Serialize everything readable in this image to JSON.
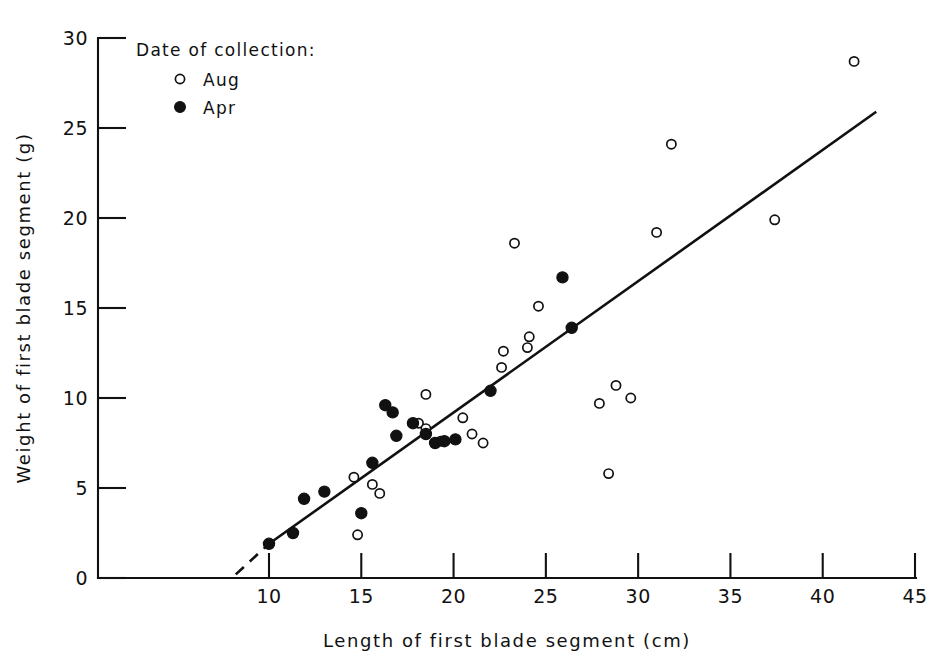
{
  "chart_data": {
    "type": "scatter",
    "title": "",
    "xlabel": "Length of first blade segment (cm)",
    "ylabel": "Weight of first blade segment (g)",
    "xlim": [
      7.0,
      45.0
    ],
    "ylim": [
      0,
      30
    ],
    "xticks": [
      10,
      15,
      20,
      25,
      30,
      35,
      40,
      45
    ],
    "yticks": [
      0,
      5,
      10,
      15,
      20,
      25,
      30
    ],
    "xtick_labels": [
      "10",
      "15",
      "20",
      "25",
      "30",
      "35",
      "40",
      "45"
    ],
    "ytick_labels": [
      "0",
      "5",
      "10",
      "15",
      "20",
      "25",
      "30"
    ],
    "grid": false,
    "legend_position": "top-left",
    "legend_title": "Date of collection:",
    "series": [
      {
        "name": "Aug",
        "marker": "open-circle",
        "color": "#111111",
        "points": [
          [
            14.6,
            5.6
          ],
          [
            14.8,
            2.4
          ],
          [
            15.6,
            5.2
          ],
          [
            16.0,
            4.7
          ],
          [
            18.1,
            8.6
          ],
          [
            18.5,
            8.3
          ],
          [
            18.5,
            10.2
          ],
          [
            19.3,
            7.6
          ],
          [
            20.5,
            8.9
          ],
          [
            21.0,
            8.0
          ],
          [
            21.6,
            7.5
          ],
          [
            22.6,
            11.7
          ],
          [
            22.7,
            12.6
          ],
          [
            23.3,
            18.6
          ],
          [
            24.0,
            12.8
          ],
          [
            24.1,
            13.4
          ],
          [
            24.6,
            15.1
          ],
          [
            27.9,
            9.7
          ],
          [
            28.4,
            5.8
          ],
          [
            28.8,
            10.7
          ],
          [
            29.6,
            10.0
          ],
          [
            31.0,
            19.2
          ],
          [
            31.8,
            24.1
          ],
          [
            37.4,
            19.9
          ],
          [
            41.7,
            28.7
          ]
        ]
      },
      {
        "name": "Apr",
        "marker": "filled-circle",
        "color": "#111111",
        "points": [
          [
            10.0,
            1.9
          ],
          [
            11.3,
            2.5
          ],
          [
            11.9,
            4.4
          ],
          [
            13.0,
            4.8
          ],
          [
            15.0,
            3.6
          ],
          [
            15.6,
            6.4
          ],
          [
            16.3,
            9.6
          ],
          [
            16.7,
            9.2
          ],
          [
            16.9,
            7.9
          ],
          [
            17.8,
            8.6
          ],
          [
            18.5,
            8.0
          ],
          [
            19.0,
            7.5
          ],
          [
            19.5,
            7.6
          ],
          [
            20.1,
            7.7
          ],
          [
            22.0,
            10.4
          ],
          [
            25.9,
            16.7
          ],
          [
            26.4,
            13.9
          ]
        ]
      }
    ],
    "fit_line": {
      "style": "solid-with-dashed-extension",
      "solid_from": [
        10.0,
        1.9
      ],
      "solid_to": [
        42.9,
        25.9
      ],
      "dashed_from": [
        8.2,
        0.2
      ],
      "dashed_to": [
        10.0,
        1.9
      ]
    }
  },
  "legend": {
    "title": "Date of collection:",
    "entries": [
      {
        "label": "Aug",
        "marker": "open-circle"
      },
      {
        "label": "Apr",
        "marker": "filled-circle"
      }
    ]
  },
  "axes": {
    "x_title": "Length of first blade segment (cm)",
    "y_title": "Weight of first blade segment (g)"
  }
}
